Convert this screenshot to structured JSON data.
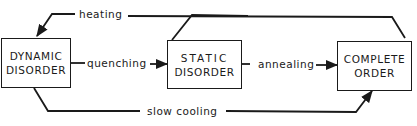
{
  "nodes": {
    "dynamic": {
      "line1": "DYNAMIC",
      "line2": "DISORDER"
    },
    "static": {
      "line1": "STATIC",
      "line2": "DISORDER"
    },
    "complete": {
      "line1": "COMPLETE",
      "line2": "ORDER"
    }
  },
  "edges": {
    "heating": "heating",
    "quenching": "quenching",
    "annealing": "annealing",
    "slow_cooling": "slow cooling"
  },
  "colors": {
    "line": "#1a1a1a",
    "background": "#ffffff"
  }
}
